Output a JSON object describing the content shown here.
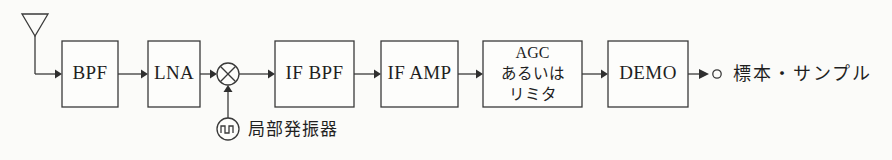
{
  "diagram": {
    "type": "block-diagram",
    "background_color": "#fbfbf9",
    "line_color": "#3a3a3a",
    "text_color": "#1f1f1f",
    "signal_line_y": 74,
    "blocks": [
      {
        "id": "bpf",
        "label": "BPF",
        "x": 62,
        "y": 41,
        "w": 56,
        "h": 66
      },
      {
        "id": "lna",
        "label": "LNA",
        "x": 148,
        "y": 41,
        "w": 52,
        "h": 66
      },
      {
        "id": "if_bpf",
        "label": "IF BPF",
        "x": 275,
        "y": 41,
        "w": 79,
        "h": 66
      },
      {
        "id": "if_amp",
        "label": "IF AMP",
        "x": 381,
        "y": 41,
        "w": 77,
        "h": 66
      },
      {
        "id": "agc",
        "label_line1": "AGC",
        "label_line2": "あるいは",
        "label_line3": "リミタ",
        "x": 483,
        "y": 41,
        "w": 99,
        "h": 66
      },
      {
        "id": "demo",
        "label": "DEMO",
        "x": 608,
        "y": 41,
        "w": 80,
        "h": 66
      }
    ],
    "symbols": [
      {
        "id": "antenna",
        "name": "antenna-symbol",
        "cx": 35,
        "top": 14,
        "bottom": 36,
        "half_width": 13
      },
      {
        "id": "mixer",
        "name": "mixer-symbol",
        "cx": 228,
        "cy": 74,
        "r": 11
      },
      {
        "id": "oscillator",
        "name": "local-oscillator-symbol",
        "cx": 228,
        "cy": 129,
        "r": 11
      },
      {
        "id": "output_terminal",
        "name": "output-terminal",
        "cx": 717,
        "cy": 74,
        "r": 4
      }
    ],
    "labels": {
      "local_oscillator": "局部発振器",
      "output": "標本・サンプル"
    },
    "connections": [
      {
        "from": "antenna",
        "to": "bpf",
        "style": "elbow-arrow"
      },
      {
        "from": "bpf",
        "to": "lna",
        "style": "arrow"
      },
      {
        "from": "lna",
        "to": "mixer",
        "style": "arrow"
      },
      {
        "from": "oscillator",
        "to": "mixer",
        "style": "arrow-up"
      },
      {
        "from": "mixer",
        "to": "if_bpf",
        "style": "arrow"
      },
      {
        "from": "if_bpf",
        "to": "if_amp",
        "style": "arrow"
      },
      {
        "from": "if_amp",
        "to": "agc",
        "style": "arrow"
      },
      {
        "from": "agc",
        "to": "demo",
        "style": "arrow"
      },
      {
        "from": "demo",
        "to": "output_terminal",
        "style": "arrow"
      }
    ]
  }
}
